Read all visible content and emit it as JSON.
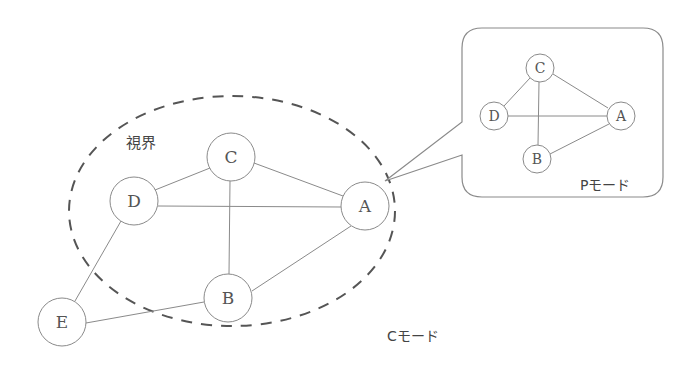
{
  "diagram": {
    "type": "graph-network",
    "main_graph": {
      "mode_label": "Cモード",
      "field_of_view_label": "視界",
      "nodes": [
        {
          "id": "C",
          "label": "C",
          "x": 231,
          "y": 157,
          "r": 24
        },
        {
          "id": "D",
          "label": "D",
          "x": 134,
          "y": 201,
          "r": 24
        },
        {
          "id": "A",
          "label": "A",
          "x": 365,
          "y": 206,
          "r": 24
        },
        {
          "id": "B",
          "label": "B",
          "x": 228,
          "y": 298,
          "r": 24
        },
        {
          "id": "E",
          "label": "E",
          "x": 62,
          "y": 322,
          "r": 24
        }
      ],
      "edges": [
        [
          "C",
          "D"
        ],
        [
          "C",
          "A"
        ],
        [
          "C",
          "B"
        ],
        [
          "D",
          "A"
        ],
        [
          "D",
          "E"
        ],
        [
          "A",
          "B"
        ],
        [
          "B",
          "E"
        ]
      ]
    },
    "inset_graph": {
      "mode_label": "Pモード",
      "nodes": [
        {
          "id": "C",
          "label": "C",
          "x": 540,
          "y": 68,
          "r": 14
        },
        {
          "id": "D",
          "label": "D",
          "x": 494,
          "y": 116,
          "r": 14
        },
        {
          "id": "A",
          "label": "A",
          "x": 621,
          "y": 116,
          "r": 14
        },
        {
          "id": "B",
          "label": "B",
          "x": 537,
          "y": 159,
          "r": 14
        }
      ],
      "edges": [
        [
          "C",
          "D"
        ],
        [
          "C",
          "A"
        ],
        [
          "C",
          "B"
        ],
        [
          "D",
          "A"
        ],
        [
          "A",
          "B"
        ]
      ]
    },
    "colors": {
      "line": "#8a8a8a",
      "dashed_boundary": "#555555",
      "text": "#444444"
    }
  }
}
